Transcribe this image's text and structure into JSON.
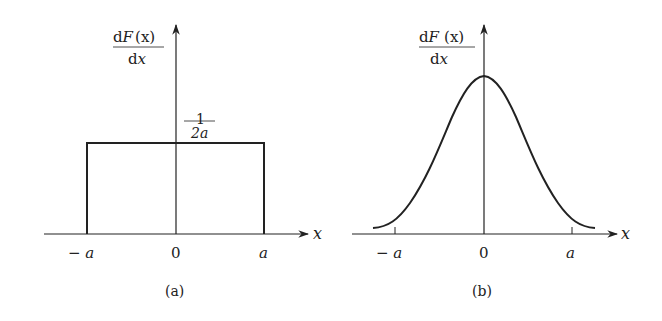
{
  "panels": [
    {
      "id": "a",
      "caption": "(a)",
      "y_label_num": "dF(x)",
      "y_label_num_d": "d",
      "y_label_num_F": "F",
      "y_label_num_arg": "(x)",
      "y_label_den_d": "d",
      "y_label_den_x": "x",
      "x_axis_label": "x",
      "tick_labels": {
        "neg_a": "− a",
        "zero": "0",
        "pos_a": "a"
      },
      "height_label_num": "1",
      "height_label_den": "2a",
      "shape": "uniform (rectangular) density"
    },
    {
      "id": "b",
      "caption": "(b)",
      "y_label_num_d": "d",
      "y_label_num_F": "F",
      "y_label_num_arg": "(x)",
      "y_label_den_d": "d",
      "y_label_den_x": "x",
      "x_axis_label": "x",
      "tick_labels": {
        "neg_a": "− a",
        "zero": "0",
        "pos_a": "a"
      },
      "shape": "bell-shaped (normal-like) density"
    }
  ],
  "colors": {
    "ink": "#222222",
    "background": "#ffffff"
  }
}
